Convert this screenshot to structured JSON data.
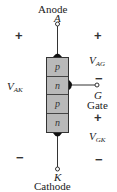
{
  "diagram": {
    "terminals": {
      "anode": {
        "name": "Anode",
        "symbol": "A"
      },
      "gate": {
        "name": "Gate",
        "symbol": "G"
      },
      "cathode": {
        "name": "Cathode",
        "symbol": "K"
      }
    },
    "layers": [
      "p",
      "n",
      "p",
      "n"
    ],
    "voltages": {
      "vak": {
        "main": "V",
        "sub": "AK",
        "plus": "+",
        "minus": "−"
      },
      "vag": {
        "main": "V",
        "sub": "AG",
        "plus": "+",
        "minus": "−"
      },
      "vgk": {
        "main": "V",
        "sub": "GK",
        "plus": "+",
        "minus": "−"
      }
    },
    "colors": {
      "layer_fill": "#b9b9b9",
      "line": "#333333"
    }
  }
}
